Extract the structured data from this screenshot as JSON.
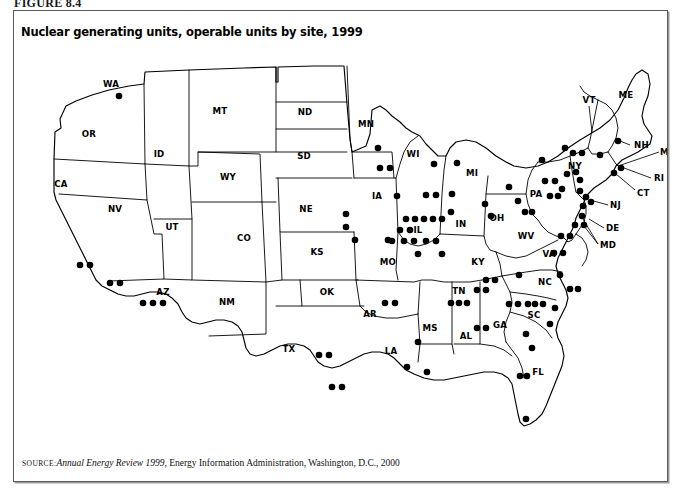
{
  "figure": {
    "label": "FIGURE 8.4",
    "title": "Nuclear generating units, operable units by site, 1999"
  },
  "source": {
    "prefix": "SOURCE:",
    "italic_part": "Annual Energy Review 1999",
    "rest": ", Energy Information Administration, Washington, D.C., 2000"
  },
  "colors": {
    "ink": "#000000",
    "frame": "#5a5a5a",
    "background": "#ffffff",
    "dot": "#000000"
  },
  "map": {
    "projection_note": "contiguous United States, state outlines",
    "state_labels": [
      {
        "abbr": "WA",
        "x": 97,
        "y": 40
      },
      {
        "abbr": "OR",
        "x": 75,
        "y": 90
      },
      {
        "abbr": "CA",
        "x": 47,
        "y": 140
      },
      {
        "abbr": "NV",
        "x": 101,
        "y": 165
      },
      {
        "abbr": "ID",
        "x": 145,
        "y": 110
      },
      {
        "abbr": "MT",
        "x": 206,
        "y": 67
      },
      {
        "abbr": "WY",
        "x": 214,
        "y": 133
      },
      {
        "abbr": "UT",
        "x": 158,
        "y": 183
      },
      {
        "abbr": "AZ",
        "x": 149,
        "y": 248
      },
      {
        "abbr": "NM",
        "x": 213,
        "y": 258
      },
      {
        "abbr": "CO",
        "x": 230,
        "y": 194
      },
      {
        "abbr": "ND",
        "x": 291,
        "y": 68
      },
      {
        "abbr": "SD",
        "x": 290,
        "y": 112
      },
      {
        "abbr": "NE",
        "x": 292,
        "y": 165
      },
      {
        "abbr": "KS",
        "x": 303,
        "y": 208
      },
      {
        "abbr": "OK",
        "x": 313,
        "y": 248
      },
      {
        "abbr": "TX",
        "x": 275,
        "y": 305
      },
      {
        "abbr": "MN",
        "x": 352,
        "y": 80
      },
      {
        "abbr": "IA",
        "x": 363,
        "y": 152
      },
      {
        "abbr": "MO",
        "x": 374,
        "y": 218
      },
      {
        "abbr": "AR",
        "x": 356,
        "y": 270
      },
      {
        "abbr": "LA",
        "x": 377,
        "y": 307
      },
      {
        "abbr": "MS",
        "x": 416,
        "y": 284
      },
      {
        "abbr": "AL",
        "x": 452,
        "y": 292
      },
      {
        "abbr": "WI",
        "x": 399,
        "y": 110
      },
      {
        "abbr": "IL",
        "x": 404,
        "y": 186
      },
      {
        "abbr": "MI",
        "x": 458,
        "y": 129
      },
      {
        "abbr": "IN",
        "x": 447,
        "y": 180
      },
      {
        "abbr": "OH",
        "x": 483,
        "y": 174
      },
      {
        "abbr": "KY",
        "x": 464,
        "y": 218
      },
      {
        "abbr": "TN",
        "x": 445,
        "y": 247
      },
      {
        "abbr": "GA",
        "x": 486,
        "y": 281
      },
      {
        "abbr": "FL",
        "x": 524,
        "y": 328
      },
      {
        "abbr": "SC",
        "x": 520,
        "y": 271
      },
      {
        "abbr": "NC",
        "x": 531,
        "y": 238
      },
      {
        "abbr": "VA",
        "x": 535,
        "y": 210
      },
      {
        "abbr": "WV",
        "x": 512,
        "y": 192
      },
      {
        "abbr": "PA",
        "x": 522,
        "y": 150
      },
      {
        "abbr": "NY",
        "x": 561,
        "y": 122
      },
      {
        "abbr": "VT",
        "x": 575,
        "y": 56
      },
      {
        "abbr": "ME",
        "x": 612,
        "y": 51
      }
    ],
    "callout_labels": [
      {
        "abbr": "NH",
        "x": 620,
        "y": 104
      },
      {
        "abbr": "MA",
        "x": 648,
        "y": 111
      },
      {
        "abbr": "RI",
        "x": 641,
        "y": 137
      },
      {
        "abbr": "CT",
        "x": 623,
        "y": 152
      },
      {
        "abbr": "NJ",
        "x": 596,
        "y": 164
      },
      {
        "abbr": "DE",
        "x": 592,
        "y": 187
      },
      {
        "abbr": "MD",
        "x": 586,
        "y": 204
      }
    ],
    "legend_note": "each filled dot represents one operable nuclear generating unit at a site",
    "unit_dot_count": 104,
    "units_by_state": {
      "WA": 1,
      "CA": 4,
      "AZ": 3,
      "TX": 4,
      "MN": 3,
      "NE": 3,
      "KS": 1,
      "MO": 1,
      "IA": 1,
      "WI": 3,
      "IL": 13,
      "MI": 5,
      "IN": 0,
      "OH": 3,
      "AR": 2,
      "LA": 3,
      "MS": 1,
      "AL": 5,
      "TN": 5,
      "GA": 4,
      "SC": 7,
      "NC": 5,
      "FL": 6,
      "VA": 4,
      "PA": 9,
      "NY": 6,
      "NJ": 4,
      "MD": 2,
      "CT": 2,
      "MA": 1,
      "NH": 1,
      "VT": 1
    }
  }
}
